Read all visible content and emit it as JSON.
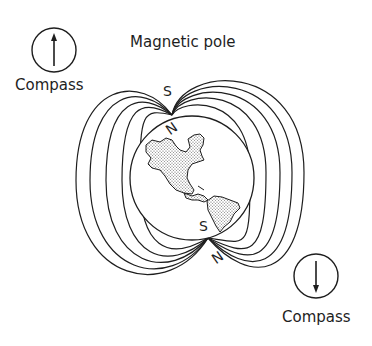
{
  "diagram": {
    "title": "Magnetic pole",
    "compasses": [
      {
        "label": "Compass",
        "needle_direction": "up"
      },
      {
        "label": "Compass",
        "needle_direction": "down"
      }
    ],
    "poles": {
      "top": {
        "outer_letter": "S",
        "inner_letter": "N"
      },
      "bottom": {
        "outer_letter": "N",
        "inner_letter": "S"
      }
    },
    "globe": {
      "depicted": "North and South America"
    },
    "field_lines_per_side": 5,
    "colors": {
      "ink": "#1e1e1e",
      "land_fill": "#d8d8d8",
      "background": "#ffffff"
    }
  }
}
